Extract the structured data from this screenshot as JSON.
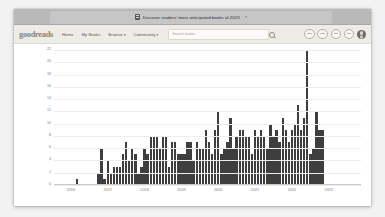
{
  "browser": {
    "tab": {
      "title": "Discover readers' most anticipated books of 2023",
      "favicon": "book-icon",
      "close_label": "×"
    }
  },
  "site": {
    "logo": "goodreads",
    "nav_links": [
      {
        "label": "Home",
        "caret": ""
      },
      {
        "label": "My Books",
        "caret": ""
      },
      {
        "label": "Browse",
        "caret": "▾"
      },
      {
        "label": "Community",
        "caret": "▾"
      }
    ],
    "search": {
      "placeholder": "Search books",
      "value": "",
      "icon": "search-icon"
    },
    "toolbar_icons": [
      "notifications-icon",
      "friends-icon",
      "messages-icon",
      "updates-icon"
    ],
    "avatar": "user-avatar"
  },
  "colors": {
    "bar": "#3e3e3e",
    "grid": "#ececec",
    "axis": "#c9c9c9",
    "tick_text": "#7b7b7b",
    "nav_bg": "#eeece7",
    "logo": "#8a8578",
    "tab_bg": "#c6c6c6",
    "tabstrip_bg": "#b9b9b9"
  },
  "chart_data": {
    "type": "bar",
    "title": "",
    "xlabel": "",
    "ylabel": "",
    "ylim": [
      0,
      22
    ],
    "yticks": [
      0,
      2,
      4,
      6,
      8,
      10,
      12,
      14,
      16,
      18,
      20,
      22
    ],
    "grid": true,
    "legend": "none",
    "x_tick_labels": [
      "2016",
      "2017",
      "2018",
      "2019",
      "2020",
      "2021",
      "2022",
      "2023"
    ],
    "x_tick_positions": [
      5,
      17,
      29,
      41,
      53,
      65,
      77,
      89
    ],
    "x_axis_type": "monthly-time-series",
    "n_bars": 100,
    "categories": [
      "2015-09",
      "2015-10",
      "2015-11",
      "2015-12",
      "2016-01",
      "2016-02",
      "2016-03",
      "2016-04",
      "2016-05",
      "2016-06",
      "2016-07",
      "2016-08",
      "2016-09",
      "2016-10",
      "2016-11",
      "2016-12",
      "2017-01",
      "2017-02",
      "2017-03",
      "2017-04",
      "2017-05",
      "2017-06",
      "2017-07",
      "2017-08",
      "2017-09",
      "2017-10",
      "2017-11",
      "2017-12",
      "2018-01",
      "2018-02",
      "2018-03",
      "2018-04",
      "2018-05",
      "2018-06",
      "2018-07",
      "2018-08",
      "2018-09",
      "2018-10",
      "2018-11",
      "2018-12",
      "2019-01",
      "2019-02",
      "2019-03",
      "2019-04",
      "2019-05",
      "2019-06",
      "2019-07",
      "2019-08",
      "2019-09",
      "2019-10",
      "2019-11",
      "2019-12",
      "2020-01",
      "2020-02",
      "2020-03",
      "2020-04",
      "2020-05",
      "2020-06",
      "2020-07",
      "2020-08",
      "2020-09",
      "2020-10",
      "2020-11",
      "2020-12",
      "2021-01",
      "2021-02",
      "2021-03",
      "2021-04",
      "2021-05",
      "2021-06",
      "2021-07",
      "2021-08",
      "2021-09",
      "2021-10",
      "2021-11",
      "2021-12",
      "2022-01",
      "2022-02",
      "2022-03",
      "2022-04",
      "2022-05",
      "2022-06",
      "2022-07",
      "2022-08",
      "2022-09",
      "2022-10",
      "2022-11",
      "2022-12",
      "2023-01",
      "2023-02",
      "2023-03",
      "2023-04",
      "2023-05",
      "2023-06",
      "2023-07",
      "2023-08",
      "2023-09",
      "2023-10",
      "2023-11",
      "2023-12"
    ],
    "values": [
      0,
      0,
      0,
      0,
      0,
      0,
      0,
      1,
      0,
      0,
      0,
      0,
      0,
      0,
      2,
      6,
      1,
      4,
      2,
      3,
      3,
      3,
      5,
      7,
      4,
      6,
      5,
      2,
      3,
      6,
      5,
      8,
      8,
      8,
      6,
      8,
      8,
      3,
      7,
      7,
      5,
      5,
      5,
      7,
      7,
      4,
      7,
      6,
      6,
      9,
      7,
      5,
      9,
      12,
      5,
      6,
      7,
      11,
      6,
      8,
      9,
      9,
      8,
      8,
      5,
      9,
      8,
      9,
      8,
      6,
      10,
      8,
      9,
      7,
      11,
      9,
      7,
      9,
      10,
      13,
      9,
      11,
      22,
      5,
      6,
      12,
      9,
      9,
      0,
      0,
      0,
      0,
      0,
      0,
      0,
      0,
      0,
      0,
      0,
      0
    ]
  }
}
